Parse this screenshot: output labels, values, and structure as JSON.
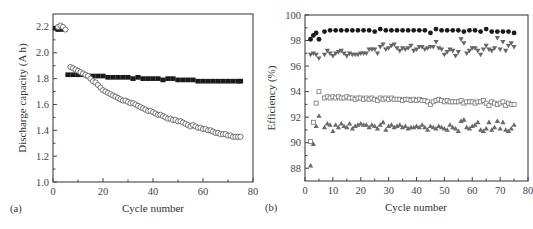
{
  "figure": {
    "panel_a_label": "(a)",
    "panel_b_label": "(b)"
  },
  "chart_data": [
    {
      "type": "scatter",
      "panel": "(a)",
      "title": "",
      "xlabel": "Cycle number",
      "ylabel": "Discharge capacity (A h)",
      "xlim": [
        0,
        80
      ],
      "ylim": [
        1.0,
        2.3
      ],
      "xticks": [
        0,
        20,
        40,
        60,
        80
      ],
      "yticks": [
        1.0,
        1.2,
        1.4,
        1.6,
        1.8,
        2.0,
        2.2
      ],
      "ytick_labels": [
        "1.0",
        "1.2",
        "1.4",
        "1.6",
        "1.8",
        "2.0",
        "2.2"
      ],
      "grid": false,
      "legend": null,
      "series": [
        {
          "name": "filled squares",
          "marker": "square-filled",
          "color": "#1a1a1a",
          "x": [
            1,
            2,
            3,
            4,
            6,
            8,
            10,
            12,
            14,
            16,
            18,
            20,
            22,
            24,
            26,
            28,
            30,
            32,
            34,
            36,
            38,
            40,
            42,
            44,
            46,
            48,
            50,
            52,
            54,
            56,
            58,
            60,
            62,
            64,
            66,
            68,
            70,
            72,
            74,
            75
          ],
          "y": [
            2.19,
            2.18,
            2.19,
            2.18,
            1.83,
            1.83,
            1.83,
            1.83,
            1.82,
            1.82,
            1.82,
            1.82,
            1.81,
            1.81,
            1.81,
            1.81,
            1.81,
            1.8,
            1.81,
            1.8,
            1.8,
            1.8,
            1.8,
            1.79,
            1.8,
            1.8,
            1.79,
            1.79,
            1.79,
            1.79,
            1.78,
            1.78,
            1.78,
            1.78,
            1.78,
            1.78,
            1.78,
            1.78,
            1.78,
            1.78
          ]
        },
        {
          "name": "open circles",
          "marker": "circle-open",
          "color": "#555555",
          "x": [
            2,
            3,
            4,
            5,
            7,
            8,
            9,
            10,
            11,
            12,
            13,
            14,
            15,
            16,
            17,
            18,
            19,
            20,
            21,
            22,
            23,
            24,
            25,
            26,
            27,
            28,
            29,
            30,
            31,
            32,
            33,
            34,
            35,
            36,
            37,
            38,
            39,
            40,
            41,
            42,
            43,
            44,
            45,
            46,
            47,
            48,
            49,
            50,
            51,
            52,
            53,
            54,
            55,
            56,
            57,
            58,
            59,
            60,
            61,
            62,
            63,
            64,
            65,
            66,
            67,
            68,
            69,
            70,
            71,
            72,
            73,
            74,
            75
          ],
          "y": [
            2.2,
            2.21,
            2.2,
            2.18,
            1.89,
            1.88,
            1.87,
            1.86,
            1.85,
            1.84,
            1.83,
            1.82,
            1.8,
            1.78,
            1.77,
            1.75,
            1.73,
            1.71,
            1.7,
            1.69,
            1.68,
            1.67,
            1.66,
            1.65,
            1.64,
            1.63,
            1.63,
            1.62,
            1.61,
            1.61,
            1.6,
            1.59,
            1.58,
            1.57,
            1.56,
            1.55,
            1.55,
            1.54,
            1.53,
            1.52,
            1.52,
            1.51,
            1.5,
            1.49,
            1.49,
            1.48,
            1.48,
            1.47,
            1.47,
            1.46,
            1.45,
            1.44,
            1.43,
            1.44,
            1.43,
            1.42,
            1.42,
            1.41,
            1.41,
            1.4,
            1.4,
            1.39,
            1.38,
            1.38,
            1.37,
            1.37,
            1.37,
            1.36,
            1.36,
            1.35,
            1.35,
            1.35,
            1.35
          ]
        }
      ]
    },
    {
      "type": "scatter",
      "panel": "(b)",
      "title": "",
      "xlabel": "Cycle number",
      "ylabel": "Efficiency (%)",
      "xlim": [
        0,
        80
      ],
      "ylim": [
        87,
        100
      ],
      "xticks": [
        0,
        10,
        20,
        30,
        40,
        50,
        60,
        70,
        80
      ],
      "yticks": [
        88,
        90,
        92,
        94,
        96,
        98,
        100
      ],
      "grid": false,
      "legend": null,
      "series": [
        {
          "name": "filled circles",
          "marker": "circle-filled",
          "color": "#1a1a1a",
          "x": [
            2,
            3,
            4,
            5,
            7,
            9,
            11,
            13,
            15,
            17,
            19,
            21,
            23,
            25,
            27,
            29,
            31,
            33,
            35,
            37,
            39,
            41,
            43,
            45,
            47,
            49,
            51,
            53,
            55,
            57,
            59,
            61,
            63,
            65,
            67,
            69,
            71,
            73,
            75
          ],
          "y": [
            98.1,
            98.4,
            98.6,
            98.1,
            98.7,
            98.8,
            98.8,
            98.8,
            98.8,
            98.8,
            98.8,
            98.8,
            98.8,
            98.7,
            98.9,
            98.8,
            98.8,
            98.8,
            98.8,
            98.8,
            98.8,
            98.8,
            98.8,
            98.6,
            98.9,
            98.8,
            98.8,
            98.8,
            98.8,
            98.7,
            98.8,
            98.8,
            98.7,
            98.9,
            98.7,
            98.7,
            98.7,
            98.7,
            98.6
          ]
        },
        {
          "name": "filled down-triangles",
          "marker": "triangle-down-filled",
          "color": "#666666",
          "x": [
            2,
            3,
            4,
            5,
            7,
            8,
            9,
            10,
            11,
            12,
            13,
            14,
            15,
            16,
            17,
            18,
            19,
            20,
            21,
            22,
            23,
            24,
            25,
            26,
            27,
            28,
            29,
            30,
            31,
            32,
            33,
            34,
            35,
            36,
            37,
            38,
            39,
            40,
            41,
            42,
            43,
            44,
            45,
            46,
            47,
            48,
            49,
            50,
            51,
            52,
            53,
            54,
            55,
            56,
            57,
            58,
            59,
            60,
            61,
            62,
            63,
            64,
            65,
            66,
            67,
            68,
            69,
            70,
            71,
            72,
            73,
            74,
            75
          ],
          "y": [
            96.9,
            97.0,
            96.9,
            96.6,
            96.9,
            97.2,
            97.0,
            96.8,
            97.0,
            97.1,
            97.2,
            97.0,
            96.8,
            97.0,
            96.9,
            96.9,
            96.9,
            97.0,
            97.0,
            97.0,
            97.3,
            97.3,
            97.3,
            97.0,
            97.5,
            97.7,
            97.3,
            97.4,
            97.6,
            97.7,
            97.4,
            97.2,
            97.4,
            97.3,
            97.4,
            97.6,
            97.2,
            97.3,
            97.5,
            97.5,
            97.3,
            97.4,
            97.5,
            97.5,
            97.9,
            97.4,
            97.3,
            96.9,
            97.1,
            97.3,
            97.2,
            96.8,
            97.1,
            98.1,
            97.8,
            97.0,
            97.2,
            97.4,
            97.4,
            97.2,
            96.9,
            97.3,
            97.6,
            97.3,
            97.2,
            97.4,
            98.2,
            97.3,
            97.9,
            97.2,
            97.6,
            97.8,
            97.5
          ]
        },
        {
          "name": "open squares",
          "marker": "square-open",
          "color": "#777777",
          "x": [
            2,
            3,
            4,
            5,
            7,
            8,
            9,
            10,
            11,
            12,
            13,
            14,
            15,
            16,
            17,
            18,
            19,
            20,
            21,
            22,
            23,
            24,
            25,
            26,
            27,
            28,
            29,
            30,
            31,
            32,
            33,
            34,
            35,
            36,
            37,
            38,
            39,
            40,
            41,
            42,
            43,
            44,
            45,
            46,
            47,
            48,
            49,
            50,
            51,
            52,
            53,
            54,
            55,
            56,
            57,
            58,
            59,
            60,
            61,
            62,
            63,
            64,
            65,
            66,
            67,
            68,
            69,
            70,
            71,
            72,
            73,
            74,
            75
          ],
          "y": [
            90.1,
            91.6,
            93.1,
            94.0,
            93.5,
            93.6,
            93.5,
            93.6,
            93.5,
            93.6,
            93.5,
            93.5,
            93.6,
            93.5,
            93.5,
            93.4,
            93.5,
            93.5,
            93.4,
            93.5,
            93.4,
            93.5,
            93.4,
            93.3,
            93.5,
            93.4,
            93.5,
            93.4,
            93.5,
            93.4,
            93.4,
            93.4,
            93.3,
            93.4,
            93.4,
            93.3,
            93.4,
            93.3,
            93.4,
            93.3,
            93.3,
            93.2,
            93.0,
            93.2,
            93.3,
            93.4,
            93.3,
            93.2,
            93.3,
            93.2,
            93.2,
            93.2,
            93.2,
            93.3,
            93.1,
            93.2,
            93.2,
            93.2,
            93.1,
            93.2,
            93.2,
            93.3,
            93.1,
            92.9,
            93.2,
            93.1,
            93.0,
            93.1,
            93.2,
            92.9,
            93.1,
            93.0,
            93.0
          ]
        },
        {
          "name": "filled up-triangles",
          "marker": "triangle-up-filled",
          "color": "#6a6a6a",
          "x": [
            2,
            3,
            4,
            5,
            7,
            8,
            9,
            10,
            11,
            12,
            13,
            14,
            15,
            16,
            17,
            18,
            19,
            20,
            21,
            22,
            23,
            24,
            25,
            26,
            27,
            28,
            29,
            30,
            31,
            32,
            33,
            34,
            35,
            36,
            37,
            38,
            39,
            40,
            41,
            42,
            43,
            44,
            45,
            46,
            47,
            48,
            49,
            50,
            51,
            52,
            53,
            54,
            55,
            56,
            57,
            58,
            59,
            60,
            61,
            62,
            63,
            64,
            65,
            66,
            67,
            68,
            69,
            70,
            71,
            72,
            73,
            74,
            75
          ],
          "y": [
            88.2,
            89.9,
            91.3,
            92.1,
            91.2,
            91.5,
            91.4,
            90.9,
            91.4,
            91.2,
            91.5,
            91.3,
            91.2,
            91.5,
            91.1,
            91.3,
            91.4,
            91.5,
            91.4,
            91.4,
            91.2,
            91.4,
            91.3,
            91.1,
            91.4,
            91.6,
            91.0,
            91.3,
            91.4,
            91.2,
            91.3,
            91.4,
            91.2,
            91.3,
            91.1,
            91.2,
            91.2,
            91.3,
            91.2,
            91.4,
            91.2,
            91.0,
            91.3,
            91.2,
            91.1,
            91.3,
            91.2,
            91.1,
            91.0,
            91.4,
            91.2,
            91.1,
            90.9,
            91.7,
            91.8,
            91.2,
            91.1,
            91.3,
            91.4,
            91.6,
            91.0,
            90.9,
            91.1,
            91.6,
            91.0,
            91.2,
            91.7,
            91.1,
            91.6,
            91.0,
            90.9,
            91.1,
            91.4
          ]
        }
      ]
    }
  ]
}
